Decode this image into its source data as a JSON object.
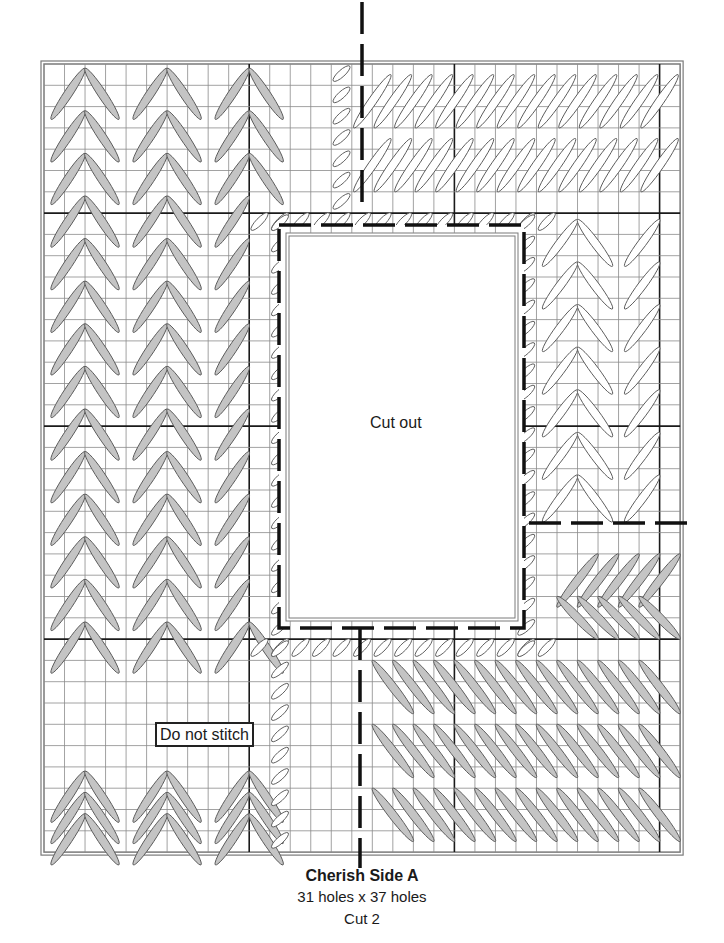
{
  "diagram": {
    "type": "needlepoint-chart",
    "title": "Cherish Side A",
    "size_label": "31 holes x 37 holes",
    "cut_label": "Cut 2",
    "labels": {
      "cut_out": "Cut out",
      "do_not_stitch": "Do not stitch"
    },
    "grid": {
      "columns": 31,
      "rows": 37,
      "origin_x": 44,
      "origin_y": 64,
      "cell_w": 20.52,
      "cell_h": 21.3,
      "heavy_cols": [
        10,
        20,
        30
      ],
      "heavy_rows": [
        7,
        17,
        27
      ],
      "line_color": "#8a8a8a",
      "heavy_color": "#1a1a1a",
      "border_color": "#7a7a7a"
    },
    "cutout": {
      "col_start": 12,
      "row_start": 8,
      "col_end": 23,
      "row_end": 26,
      "dash_left_x": 279,
      "dash_top_y": 225,
      "dash_right_x": 524,
      "dash_bottom_y": 628,
      "box_left": 289,
      "box_top": 236,
      "box_right": 515,
      "box_bottom": 618
    },
    "dashed_lines": [
      {
        "x1": 362,
        "y1": 2,
        "x2": 362,
        "y2": 212
      },
      {
        "x1": 360,
        "y1": 628,
        "x2": 360,
        "y2": 868
      },
      {
        "x1": 529,
        "y1": 523,
        "x2": 690,
        "y2": 523
      }
    ],
    "colors": {
      "gray_stitch_fill": "#c4c4c4",
      "white_stitch_fill": "#ffffff",
      "stitch_stroke": "#5a5a5a",
      "dash": "#111111"
    },
    "regions": [
      {
        "name": "left-chevron",
        "fill": "gray",
        "col_start": 0,
        "col_end": 12,
        "row_start": 0,
        "row_end": 37
      },
      {
        "name": "top-right",
        "fill": "white",
        "col_start": 15,
        "col_end": 31,
        "row_start": 0,
        "row_end": 7
      },
      {
        "name": "right-column",
        "fill": "white",
        "col_start": 24,
        "col_end": 31,
        "row_start": 7,
        "row_end": 22
      },
      {
        "name": "right-lower",
        "fill": "gray",
        "col_start": 24,
        "col_end": 31,
        "row_start": 22,
        "row_end": 27
      },
      {
        "name": "bottom-right",
        "fill": "gray",
        "col_start": 15,
        "col_end": 31,
        "row_start": 27,
        "row_end": 37
      },
      {
        "name": "do-not-stitch",
        "fill": "none",
        "col_start": 1,
        "col_end": 12,
        "row_start": 29,
        "row_end": 33
      }
    ]
  }
}
